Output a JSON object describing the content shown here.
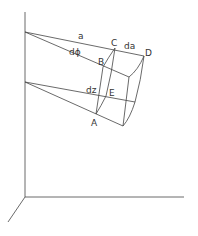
{
  "figure": {
    "labels": {
      "a": "a",
      "dphi": "dϕ",
      "da": "da",
      "dz": "dz",
      "A": "A",
      "B": "B",
      "C": "C",
      "D": "D",
      "E": "E"
    }
  }
}
